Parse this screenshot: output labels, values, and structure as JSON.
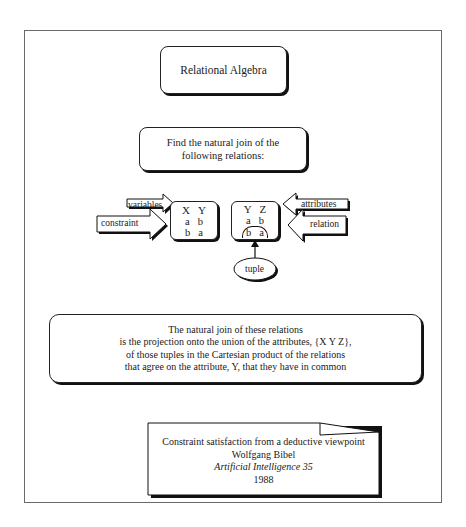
{
  "title": "Relational Algebra",
  "task": {
    "line1": "Find the natural join of the",
    "line2": "following relations:"
  },
  "relations": {
    "left": {
      "attributes": [
        "X",
        "Y"
      ],
      "tuples": [
        [
          "a",
          "b"
        ],
        [
          "b",
          "a"
        ]
      ]
    },
    "right": {
      "attributes": [
        "Y",
        "Z"
      ],
      "tuples": [
        [
          "a",
          "b"
        ],
        [
          "b",
          "a"
        ]
      ]
    }
  },
  "annotations": {
    "variables": "variables",
    "constraint": "constraint",
    "attributes": "attributes",
    "relation": "relation",
    "tuple": "tuple"
  },
  "definition": {
    "line1": "The natural join of these relations",
    "line2": "is the projection onto the union of the attributes, {X Y Z},",
    "line3": "of those tuples in the Cartesian product of the relations",
    "line4": "that agree on the attribute, Y, that they have in common"
  },
  "citation": {
    "title": "Constraint satisfaction from a deductive viewpoint",
    "author": "Wolfgang Bibel",
    "journal": "Artificial Intelligence 35",
    "year": "1988"
  }
}
